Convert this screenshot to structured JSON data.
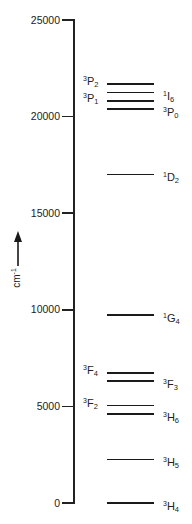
{
  "diagram": {
    "title": "",
    "axis": {
      "unit_base": "cm",
      "unit_exp": "-1",
      "arrow_icon": "up-arrow",
      "min": 0,
      "max": 25000,
      "ticks": [
        {
          "value": 25000,
          "label": "25000"
        },
        {
          "value": 20000,
          "label": "20000"
        },
        {
          "value": 15000,
          "label": "15000"
        },
        {
          "value": 10000,
          "label": "10000"
        },
        {
          "value": 5000,
          "label": "5000"
        },
        {
          "value": 0,
          "label": "0"
        }
      ]
    },
    "levels": [
      {
        "mult": "3",
        "L": "P",
        "J": "2",
        "energy": 21690,
        "side": "left"
      },
      {
        "mult": "1",
        "L": "I",
        "J": "6",
        "energy": 21240,
        "side": "right"
      },
      {
        "mult": "3",
        "L": "P",
        "J": "1",
        "energy": 20820,
        "side": "left"
      },
      {
        "mult": "3",
        "L": "P",
        "J": "0",
        "energy": 20400,
        "side": "right"
      },
      {
        "mult": "1",
        "L": "D",
        "J": "2",
        "energy": 17010,
        "side": "right"
      },
      {
        "mult": "1",
        "L": "G",
        "J": "4",
        "energy": 9730,
        "side": "right"
      },
      {
        "mult": "3",
        "L": "F",
        "J": "4",
        "energy": 6730,
        "side": "left"
      },
      {
        "mult": "3",
        "L": "F",
        "J": "3",
        "energy": 6300,
        "side": "right"
      },
      {
        "mult": "3",
        "L": "F",
        "J": "2",
        "energy": 5040,
        "side": "left"
      },
      {
        "mult": "3",
        "L": "H",
        "J": "6",
        "energy": 4620,
        "side": "right"
      },
      {
        "mult": "3",
        "L": "H",
        "J": "5",
        "energy": 2260,
        "side": "right"
      },
      {
        "mult": "3",
        "L": "H",
        "J": "4",
        "energy": 0,
        "side": "right"
      }
    ]
  },
  "chart_data": {
    "type": "energy-level-diagram",
    "title": "",
    "ylabel": "cm-1",
    "ylim": [
      0,
      25000
    ],
    "yticks": [
      0,
      5000,
      10000,
      15000,
      20000,
      25000
    ],
    "grid": false,
    "levels": [
      {
        "term": "3H4",
        "energy": 0
      },
      {
        "term": "3H5",
        "energy": 2260
      },
      {
        "term": "3H6",
        "energy": 4620
      },
      {
        "term": "3F2",
        "energy": 5040
      },
      {
        "term": "3F3",
        "energy": 6300
      },
      {
        "term": "3F4",
        "energy": 6730
      },
      {
        "term": "1G4",
        "energy": 9730
      },
      {
        "term": "1D2",
        "energy": 17010
      },
      {
        "term": "3P0",
        "energy": 20400
      },
      {
        "term": "3P1",
        "energy": 20820
      },
      {
        "term": "1I6",
        "energy": 21240
      },
      {
        "term": "3P2",
        "energy": 21690
      }
    ]
  }
}
